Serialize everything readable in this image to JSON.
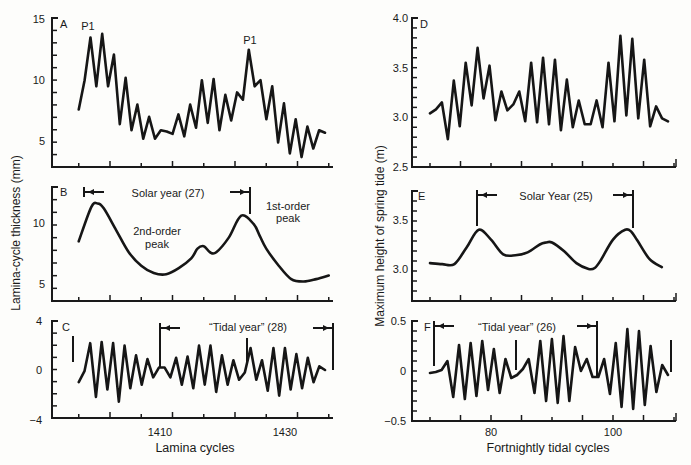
{
  "figure": {
    "left_ylabel": "Lamina-cycle thickness (mm)",
    "right_ylabel": "Maximum height of spring tide (m)",
    "left_xlabel": "Lamina cycles",
    "right_xlabel": "Fortnightly tidal cycles"
  },
  "panels": {
    "A": {
      "label": "A",
      "peak_labels": [
        "P1",
        "P1"
      ],
      "yticks": [
        "15",
        "10",
        "5"
      ]
    },
    "B": {
      "label": "B",
      "yticks": [
        "10",
        "5"
      ],
      "interval_label": "Solar year (27)",
      "annot_first": "1st-order",
      "annot_first2": "peak",
      "annot_second": "2nd-order",
      "annot_second2": "peak"
    },
    "C": {
      "label": "C",
      "yticks": [
        "4",
        "0",
        "−4"
      ],
      "xticks": [
        "1410",
        "1430"
      ],
      "interval_label": "“Tidal year” (28)"
    },
    "D": {
      "label": "D",
      "yticks": [
        "4.0",
        "3.5",
        "3.0",
        "2.5"
      ]
    },
    "E": {
      "label": "E",
      "yticks": [
        "3.5",
        "3.0"
      ],
      "interval_label": "Solar Year (25)"
    },
    "F": {
      "label": "F",
      "yticks": [
        "0.5",
        "0",
        "−0.5"
      ],
      "xticks": [
        "80",
        "100"
      ],
      "interval_label": "“Tidal year” (26)"
    }
  },
  "chart_data": [
    {
      "panel": "A",
      "type": "line",
      "title": "",
      "xlabel": "Lamina cycles",
      "ylabel": "Lamina-cycle thickness (mm)",
      "xlim": [
        1395,
        1437
      ],
      "ylim": [
        3,
        15
      ],
      "x": [
        1397,
        1398,
        1399,
        1400,
        1401,
        1402,
        1403,
        1404,
        1405,
        1406,
        1407,
        1408,
        1409,
        1410,
        1411,
        1412,
        1413,
        1414,
        1415,
        1416,
        1417,
        1418,
        1419,
        1420,
        1421,
        1422,
        1423,
        1424,
        1425,
        1426,
        1427,
        1428,
        1429,
        1430,
        1431,
        1432,
        1433,
        1434,
        1435,
        1436
      ],
      "values": [
        7.5,
        9.9,
        13.4,
        9.4,
        13.7,
        9.4,
        12.0,
        6.3,
        10.1,
        5.8,
        7.9,
        5.1,
        6.9,
        5.1,
        5.8,
        5.7,
        5.5,
        7.1,
        5.3,
        7.9,
        6.0,
        9.9,
        6.4,
        10.0,
        5.8,
        8.7,
        6.6,
        8.9,
        8.3,
        12.4,
        9.4,
        9.9,
        6.7,
        9.4,
        4.8,
        8.0,
        3.9,
        6.7,
        3.6,
        6.1,
        4.3,
        5.8,
        5.6
      ],
      "annotations": [
        "P1 at ~1400",
        "P1 at ~1426"
      ]
    },
    {
      "panel": "B",
      "type": "line",
      "xlabel": "Lamina cycles",
      "ylabel": "Lamina-cycle thickness (mm)",
      "xlim": [
        1395,
        1437
      ],
      "ylim": [
        4,
        13
      ],
      "x": [
        1397,
        1399,
        1400,
        1401,
        1403,
        1405,
        1407,
        1409,
        1411,
        1413,
        1415,
        1416,
        1417,
        1418,
        1419,
        1421,
        1423,
        1425,
        1426,
        1427,
        1429,
        1431,
        1433,
        1435,
        1437
      ],
      "values": [
        8.5,
        11.3,
        11.6,
        11.2,
        9.4,
        7.6,
        6.5,
        5.9,
        5.8,
        6.3,
        7.1,
        7.9,
        8.1,
        7.6,
        7.6,
        8.8,
        10.6,
        9.9,
        8.9,
        7.9,
        6.5,
        5.4,
        5.2,
        5.4,
        5.7
      ],
      "annotations": [
        "Solar year (27)",
        "1st-order peak",
        "2nd-order peak"
      ]
    },
    {
      "panel": "C",
      "type": "line",
      "xlabel": "Lamina cycles",
      "ylabel": "",
      "xlim": [
        1395,
        1437
      ],
      "ylim": [
        -4,
        4
      ],
      "xticks": [
        1410,
        1430
      ],
      "x": [
        1397,
        1398,
        1399,
        1400,
        1401,
        1402,
        1403,
        1404,
        1405,
        1406,
        1407,
        1408,
        1409,
        1410,
        1411,
        1412,
        1413,
        1414,
        1415,
        1416,
        1417,
        1418,
        1419,
        1420,
        1421,
        1422,
        1423,
        1424,
        1425,
        1426,
        1427,
        1428,
        1429,
        1430,
        1431,
        1432,
        1433,
        1434,
        1435,
        1436
      ],
      "values": [
        -1.0,
        -0.1,
        2.2,
        -2.2,
        2.3,
        -1.6,
        2.2,
        -2.6,
        2.0,
        -1.5,
        1.2,
        -1.2,
        0.9,
        -0.6,
        0.2,
        0.2,
        -0.6,
        1.0,
        -1.2,
        1.1,
        -1.5,
        2.0,
        -1.2,
        2.0,
        -1.8,
        1.2,
        -1.2,
        0.8,
        -0.8,
        -0.2,
        1.8,
        -0.8,
        0.8,
        -1.7,
        1.8,
        -2.1,
        1.8,
        -1.6,
        1.3,
        -1.5,
        1.0,
        -1.0,
        0.3,
        0.0
      ],
      "annotations": [
        "“Tidal year” (28)"
      ]
    },
    {
      "panel": "D",
      "type": "line",
      "xlabel": "Fortnightly tidal cycles",
      "ylabel": "Maximum height of spring tide (m)",
      "xlim": [
        69,
        110
      ],
      "ylim": [
        2.5,
        4.0
      ],
      "x": [
        70,
        71,
        72,
        73,
        74,
        75,
        76,
        77,
        78,
        79,
        80,
        81,
        82,
        83,
        84,
        85,
        86,
        87,
        88,
        89,
        90,
        91,
        92,
        93,
        94,
        95,
        96,
        97,
        98,
        99,
        100,
        101,
        102,
        103,
        104,
        105,
        106,
        107,
        108,
        109
      ],
      "values": [
        3.04,
        3.08,
        3.15,
        2.78,
        3.37,
        2.91,
        3.55,
        3.12,
        3.7,
        3.19,
        3.52,
        2.97,
        3.26,
        3.07,
        3.13,
        3.26,
        2.96,
        3.55,
        2.95,
        3.6,
        2.93,
        3.58,
        2.87,
        3.38,
        2.9,
        3.17,
        2.93,
        2.93,
        3.17,
        2.9,
        3.55,
        2.96,
        3.82,
        3.02,
        3.79,
        2.99,
        3.58,
        2.91,
        3.11,
        2.99,
        2.96
      ]
    },
    {
      "panel": "E",
      "type": "line",
      "xlabel": "Fortnightly tidal cycles",
      "ylabel": "Maximum height of spring tide (m)",
      "xlim": [
        69,
        110
      ],
      "ylim": [
        2.7,
        3.8
      ],
      "x": [
        70,
        72,
        74,
        76,
        78,
        80,
        82,
        84,
        86,
        88,
        89,
        90,
        92,
        94,
        96,
        97,
        98,
        100,
        102,
        103,
        104,
        106,
        108
      ],
      "values": [
        3.06,
        3.05,
        3.05,
        3.22,
        3.4,
        3.3,
        3.15,
        3.14,
        3.17,
        3.25,
        3.27,
        3.27,
        3.18,
        3.06,
        3.0,
        3.01,
        3.09,
        3.3,
        3.4,
        3.38,
        3.29,
        3.1,
        3.02
      ],
      "annotations": [
        "Solar Year (25)"
      ]
    },
    {
      "panel": "F",
      "type": "line",
      "xlabel": "Fortnightly tidal cycles",
      "ylabel": "",
      "xlim": [
        69,
        110
      ],
      "ylim": [
        -0.5,
        0.5
      ],
      "xticks": [
        80,
        100
      ],
      "x": [
        70,
        71,
        72,
        73,
        74,
        75,
        76,
        77,
        78,
        79,
        80,
        81,
        82,
        83,
        84,
        85,
        86,
        87,
        88,
        89,
        90,
        91,
        92,
        93,
        94,
        95,
        96,
        97,
        98,
        99,
        100,
        101,
        102,
        103,
        104,
        105,
        106,
        107,
        108,
        109
      ],
      "values": [
        -0.02,
        -0.01,
        0.01,
        0.1,
        -0.26,
        0.26,
        -0.28,
        0.28,
        -0.25,
        0.3,
        -0.19,
        0.22,
        -0.22,
        0.12,
        -0.07,
        -0.04,
        0.02,
        0.12,
        -0.22,
        0.3,
        -0.3,
        0.32,
        -0.32,
        0.35,
        -0.3,
        0.24,
        0.0,
        0.12,
        -0.06,
        -0.06,
        0.12,
        -0.23,
        0.28,
        -0.36,
        0.42,
        -0.38,
        0.4,
        -0.34,
        0.25,
        -0.21,
        0.06,
        -0.04
      ],
      "annotations": [
        "“Tidal year” (26)"
      ]
    }
  ]
}
